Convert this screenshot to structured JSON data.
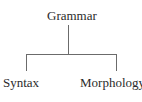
{
  "diagram": {
    "type": "tree",
    "root": {
      "label": "Grammar",
      "children": [
        {
          "label": "Syntax"
        },
        {
          "label": "Morphology"
        }
      ]
    },
    "colors": {
      "text": "#2b2b2b",
      "line": "#6b6b6b",
      "background": "#ffffff"
    }
  }
}
